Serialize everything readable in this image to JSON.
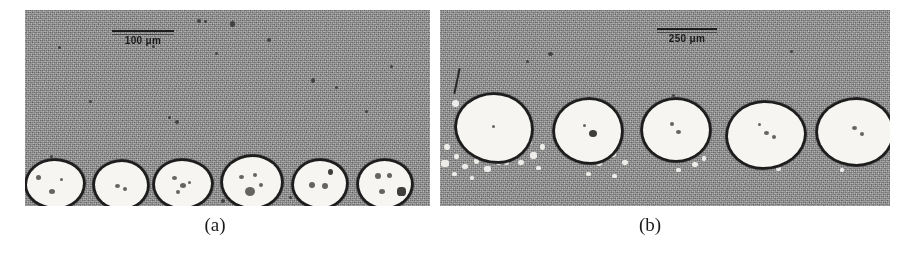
{
  "figure": {
    "background_color": "#ffffff",
    "width": 920,
    "height": 259,
    "type": "two-panel grayscale micrograph figure"
  },
  "panels": [
    {
      "id": "panel-a",
      "caption": "(a)",
      "x": 25,
      "y": 10,
      "width": 405,
      "height": 196,
      "background_color": "#8f8f8f",
      "scale_bar": {
        "label": "100 μm",
        "value": 100,
        "unit": "μm",
        "x": 112,
        "y": 30,
        "length": 62
      },
      "particle_count": 6,
      "particle_description": "white rounded particles with dark outline, single row along lower edge",
      "particles": [
        {
          "cx": 55,
          "cy": 174,
          "rx": 28,
          "ry": 23
        },
        {
          "cx": 121,
          "cy": 175,
          "rx": 26,
          "ry": 23
        },
        {
          "cx": 183,
          "cy": 174,
          "rx": 28,
          "ry": 23
        },
        {
          "cx": 252,
          "cy": 172,
          "rx": 29,
          "ry": 25
        },
        {
          "cx": 320,
          "cy": 174,
          "rx": 26,
          "ry": 23
        },
        {
          "cx": 385,
          "cy": 174,
          "rx": 26,
          "ry": 23
        }
      ]
    },
    {
      "id": "panel-b",
      "caption": "(b)",
      "x": 440,
      "y": 10,
      "width": 450,
      "height": 196,
      "background_color": "#8c8c8c",
      "scale_bar": {
        "label": "250 μm",
        "value": 250,
        "unit": "μm",
        "x": 660,
        "y": 28,
        "length": 58
      },
      "particle_count": 5,
      "particle_description": "larger white rounded particles with dark outline and bright satellite speckle clusters between them",
      "particles": [
        {
          "cx": 494,
          "cy": 128,
          "rx": 37,
          "ry": 33
        },
        {
          "cx": 588,
          "cy": 131,
          "rx": 33,
          "ry": 31
        },
        {
          "cx": 676,
          "cy": 130,
          "rx": 33,
          "ry": 30
        },
        {
          "cx": 766,
          "cy": 135,
          "rx": 38,
          "ry": 32
        },
        {
          "cx": 856,
          "cy": 132,
          "rx": 37,
          "ry": 32
        }
      ]
    }
  ],
  "colors": {
    "page_background": "#ffffff",
    "panel_gray": "#8e8e8e",
    "particle_fill": "#f6f5f2",
    "particle_outline": "#1d1d1d",
    "caption_text": "#1b1b1b"
  }
}
